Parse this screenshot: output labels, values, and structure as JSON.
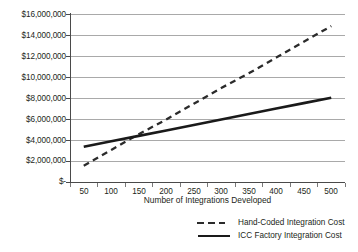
{
  "chart_data": {
    "type": "line",
    "title": "",
    "xlabel": "Number of Integrations Developed",
    "ylabel": "",
    "x": [
      50,
      100,
      150,
      200,
      250,
      300,
      350,
      400,
      450,
      500
    ],
    "xticklabels": [
      "50",
      "100",
      "150",
      "200",
      "250",
      "300",
      "350",
      "400",
      "450",
      "500"
    ],
    "yticklabels": [
      "$16,000,000",
      "$14,000,000",
      "$12,000,000",
      "$10,000,000",
      "$8,000,000",
      "$6,000,000",
      "$4,000,000",
      "$2,000,000",
      "$-"
    ],
    "yticks": [
      16000000,
      14000000,
      12000000,
      10000000,
      8000000,
      6000000,
      4000000,
      2000000,
      0
    ],
    "ylim": [
      0,
      16000000
    ],
    "xlim": [
      25,
      525
    ],
    "grid": "horizontal",
    "legend_position": "bottom-right",
    "series": [
      {
        "name": "Hand-Coded Integration Cost",
        "style": "dashed",
        "color": "#2b2b2b",
        "values": [
          1600000,
          3100000,
          4600000,
          6000000,
          7500000,
          9000000,
          10400000,
          11900000,
          13400000,
          14900000
        ]
      },
      {
        "name": "ICC Factory Integration Cost",
        "style": "solid",
        "color": "#1a1a1a",
        "values": [
          3400000,
          3920000,
          4440000,
          4960000,
          5480000,
          6000000,
          6520000,
          7040000,
          7560000,
          8080000
        ]
      }
    ]
  },
  "legend": {
    "items": [
      {
        "label": "Hand-Coded Integration Cost",
        "style": "dashed"
      },
      {
        "label": "ICC Factory Integration Cost",
        "style": "solid"
      }
    ]
  }
}
